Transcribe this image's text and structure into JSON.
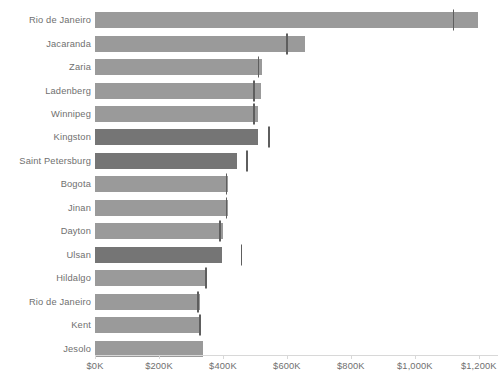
{
  "chart_data": {
    "type": "bar",
    "orientation": "horizontal",
    "title": "",
    "subtitle": "",
    "xlabel": "",
    "ylabel": "",
    "xlim": [
      0,
      1260000
    ],
    "grid": false,
    "legend": false,
    "axis_tick_format": "$0K",
    "categories": [
      "Rio de Janeiro",
      "Jacaranda",
      "Zaria",
      "Ladenberg",
      "Winnipeg",
      "Kingston",
      "Saint Petersburg",
      "Bogota",
      "Jinan",
      "Dayton",
      "Ulsan",
      "Hildalgo",
      "Rio de Janeiro",
      "Kent",
      "Jesolo"
    ],
    "values": [
      1197000,
      656000,
      522000,
      519000,
      509000,
      509000,
      444000,
      416000,
      416000,
      400000,
      397000,
      350000,
      328000,
      328000,
      338000
    ],
    "reference_values": [
      1119000,
      597000,
      509000,
      494000,
      494000,
      541000,
      472000,
      409000,
      409000,
      388000,
      456000,
      344000,
      319000,
      325000,
      null
    ],
    "series": [
      {
        "name": "Sales",
        "values": [
          1197000,
          656000,
          522000,
          519000,
          509000,
          509000,
          444000,
          416000,
          416000,
          400000,
          397000,
          350000,
          328000,
          328000,
          338000
        ]
      },
      {
        "name": "Target",
        "values": [
          1119000,
          597000,
          509000,
          494000,
          494000,
          541000,
          472000,
          409000,
          409000,
          388000,
          456000,
          344000,
          319000,
          325000,
          null
        ]
      }
    ],
    "highlighted_categories": [
      "Kingston",
      "Saint Petersburg",
      "Ulsan"
    ],
    "x_ticks": [
      {
        "label": "$0K",
        "value": 0
      },
      {
        "label": "$200K",
        "value": 200000
      },
      {
        "label": "$400K",
        "value": 400000
      },
      {
        "label": "$600K",
        "value": 600000
      },
      {
        "label": "$800K",
        "value": 800000
      },
      {
        "label": "$1,000K",
        "value": 1000000
      },
      {
        "label": "$1,200K",
        "value": 1200000
      }
    ]
  },
  "colors": {
    "bar": "#9a9a9a",
    "bar_highlight": "#757575",
    "reference_line": "#5e5e5e",
    "axis": "#d8d8d8",
    "text": "#6f6f6f",
    "background": "#ffffff"
  }
}
